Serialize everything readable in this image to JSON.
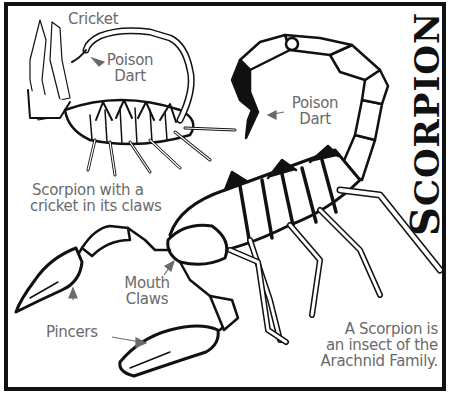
{
  "title": {
    "first_letter": "S",
    "rest": "CORPION"
  },
  "labels": {
    "cricket": "Cricket",
    "poison_dart_small_1": "Poison",
    "poison_dart_small_2": "Dart",
    "poison_dart_large_1": "Poison",
    "poison_dart_large_2": "Dart",
    "caption_1": "Scorpion with a",
    "caption_2": "cricket in its claws",
    "mouth_claws_1": "Mouth",
    "mouth_claws_2": "Claws",
    "pincers": "Pincers",
    "fact_1": "A Scorpion is",
    "fact_2": "an insect of the",
    "fact_3": "Arachnid Family."
  },
  "colors": {
    "ink": "#111111",
    "label_gray": "#6a6a6a",
    "background": "#ffffff"
  }
}
